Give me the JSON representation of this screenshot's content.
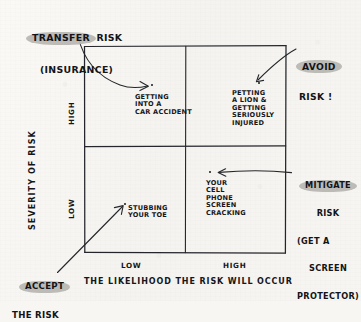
{
  "diagram": {
    "axes": {
      "y_title": "SEVERITY OF RISK",
      "x_title": "THE LIKELIHOOD THE RISK WILL OCCUR",
      "y_ticks": [
        "HIGH",
        "LOW"
      ],
      "x_ticks": [
        "LOW",
        "HIGH"
      ]
    },
    "quadrants": [
      {
        "id": "high-severity-low-likelihood",
        "example_lines": [
          "GETTING",
          "INTO A",
          "CAR ACCIDENT"
        ],
        "strategy_name": "TRANSFER RISK"
      },
      {
        "id": "high-severity-high-likelihood",
        "example_lines": [
          "PETTING",
          "A LION &",
          "GETTING",
          "SERIOUSLY",
          "INJURED"
        ],
        "strategy_name": "AVOID RISK!"
      },
      {
        "id": "low-severity-low-likelihood",
        "example_lines": [
          "STUBBING",
          "YOUR TOE"
        ],
        "strategy_name": "ACCEPT THE RISK"
      },
      {
        "id": "low-severity-high-likelihood",
        "example_lines": [
          "YOUR",
          "CELL",
          "PHONE",
          "SCREEN",
          "CRACKING"
        ],
        "strategy_name": "MITIGATE RISK"
      }
    ],
    "callouts": {
      "transfer": {
        "highlight": "TRANSFER",
        "rest": " RISK",
        "line2": "(INSURANCE)"
      },
      "avoid": {
        "highlight": "AVOID",
        "line2": "RISK !"
      },
      "mitigate": {
        "highlight": "MITIGATE",
        "line2": "RISK",
        "line3": "(GET A",
        "line4": "SCREEN",
        "line5": "PROTECTOR)"
      },
      "accept": {
        "highlight": "ACCEPT",
        "line2": "THE RISK"
      }
    },
    "colors": {
      "ink": "#15161a",
      "highlight": "#b9b7b2",
      "paper": "#f7f6f3"
    }
  }
}
